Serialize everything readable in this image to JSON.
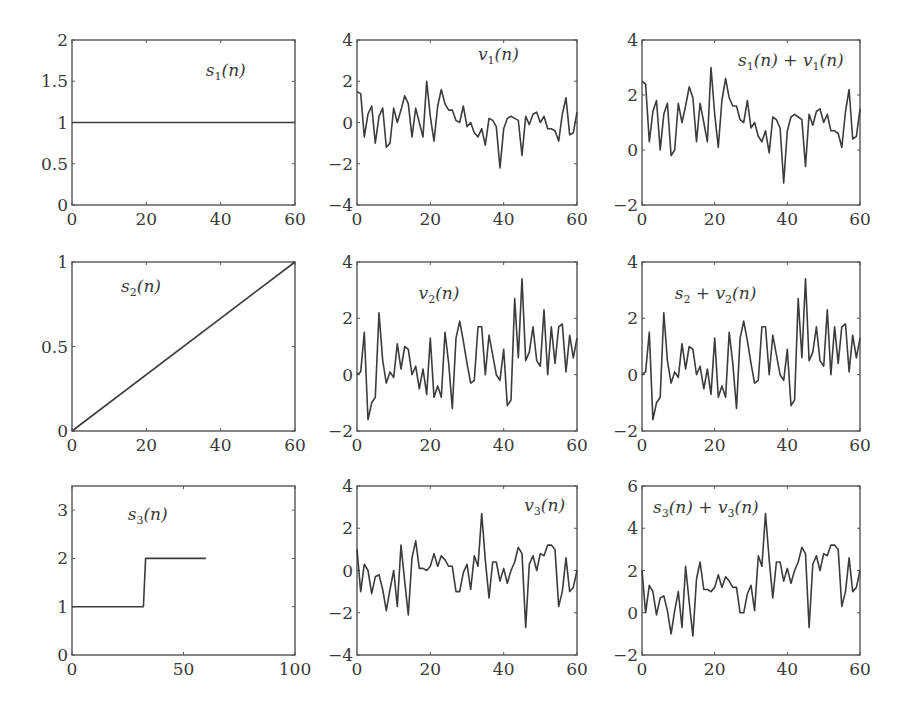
{
  "figure": {
    "layout": "3x3 grid of subplots",
    "line_color": "#3c3c3c",
    "axis_color": "#555555"
  },
  "chart_data": [
    {
      "id": "s1",
      "type": "line",
      "row": 0,
      "col": 0,
      "title": "s1(n)",
      "label_main": "s",
      "label_sub": "1",
      "label_tail": "(n)",
      "label_pos": [
        0.6,
        0.78
      ],
      "box": [
        72,
        40,
        295,
        205
      ],
      "xlim": [
        0,
        60
      ],
      "ylim": [
        0,
        2
      ],
      "xticks": [
        0,
        20,
        40,
        60
      ],
      "yticks": [
        0,
        0.5,
        1,
        1.5,
        2
      ],
      "ytick_labels": [
        "0",
        "0.5",
        "1",
        "1.5",
        "2"
      ],
      "x": [
        0,
        60
      ],
      "y": [
        1,
        1
      ]
    },
    {
      "id": "v1",
      "type": "line",
      "row": 0,
      "col": 1,
      "title": "v1(n)",
      "label_main": "v",
      "label_sub": "1",
      "label_tail": "(n)",
      "label_pos": [
        0.55,
        0.88
      ],
      "box": [
        357,
        40,
        577,
        205
      ],
      "xlim": [
        0,
        60
      ],
      "ylim": [
        -4,
        4
      ],
      "xticks": [
        0,
        20,
        40,
        60
      ],
      "yticks": [
        -4,
        -2,
        0,
        2,
        4
      ],
      "ytick_labels": [
        "−4",
        "−2",
        "0",
        "2",
        "4"
      ],
      "y": [
        1.5,
        1.4,
        -0.7,
        0.4,
        0.8,
        -1.0,
        0.3,
        0.7,
        -1.2,
        -1.0,
        0.7,
        0.0,
        0.6,
        1.3,
        0.9,
        -0.7,
        0.7,
        0.0,
        -0.7,
        2.0,
        0.3,
        -0.9,
        0.8,
        1.6,
        0.9,
        0.6,
        0.6,
        0.1,
        0.0,
        0.8,
        -0.2,
        0.0,
        -0.5,
        -0.7,
        -0.3,
        -1.1,
        0.2,
        0.1,
        -0.2,
        -2.2,
        -0.3,
        0.2,
        0.3,
        0.2,
        0.1,
        -1.6,
        0.3,
        -0.1,
        0.4,
        0.5,
        0.0,
        0.3,
        -0.3,
        -0.3,
        -0.4,
        -0.9,
        0.4,
        1.2,
        -0.6,
        -0.5,
        0.5
      ]
    },
    {
      "id": "s1v1",
      "type": "line",
      "row": 0,
      "col": 2,
      "title": "s1(n) + v1(n)",
      "label_main": "s",
      "label_sub": "1",
      "label_tail": "(n) + v",
      "label_sub2": "1",
      "label_tail2": "(n)",
      "label_pos": [
        0.44,
        0.84
      ],
      "box": [
        642,
        40,
        860,
        205
      ],
      "xlim": [
        0,
        60
      ],
      "ylim": [
        -2,
        4
      ],
      "xticks": [
        0,
        20,
        40,
        60
      ],
      "yticks": [
        -2,
        0,
        2,
        4
      ],
      "ytick_labels": [
        "−2",
        "0",
        "2",
        "4"
      ],
      "y": [
        2.5,
        2.4,
        0.3,
        1.4,
        1.8,
        0.0,
        1.3,
        1.7,
        -0.2,
        0.0,
        1.7,
        1.0,
        1.6,
        2.3,
        1.9,
        0.3,
        1.7,
        1.0,
        0.3,
        3.0,
        1.3,
        0.1,
        1.8,
        2.6,
        1.9,
        1.6,
        1.6,
        1.1,
        1.0,
        1.8,
        0.8,
        1.0,
        0.5,
        0.3,
        0.7,
        -0.1,
        1.2,
        1.1,
        0.8,
        -1.2,
        0.7,
        1.2,
        1.3,
        1.2,
        1.1,
        -0.6,
        1.3,
        0.9,
        1.4,
        1.5,
        1.0,
        1.3,
        0.7,
        0.7,
        0.6,
        0.1,
        1.4,
        2.2,
        0.4,
        0.5,
        1.5
      ]
    },
    {
      "id": "s2",
      "type": "line",
      "row": 1,
      "col": 0,
      "title": "s2(n)",
      "label_main": "s",
      "label_sub": "2",
      "label_tail": "(n)",
      "label_pos": [
        0.22,
        0.82
      ],
      "box": [
        72,
        262,
        295,
        431
      ],
      "xlim": [
        0,
        60
      ],
      "ylim": [
        0,
        1
      ],
      "xticks": [
        0,
        20,
        40,
        60
      ],
      "yticks": [
        0,
        0.5,
        1
      ],
      "ytick_labels": [
        "0",
        "0.5",
        "1"
      ],
      "x": [
        0,
        60
      ],
      "y": [
        0,
        1
      ]
    },
    {
      "id": "v2",
      "type": "line",
      "row": 1,
      "col": 1,
      "title": "v2(n)",
      "label_main": "v",
      "label_sub": "2",
      "label_tail": "(n)",
      "label_pos": [
        0.28,
        0.78
      ],
      "box": [
        357,
        262,
        577,
        431
      ],
      "xlim": [
        0,
        60
      ],
      "ylim": [
        -2,
        4
      ],
      "xticks": [
        0,
        20,
        40,
        60
      ],
      "yticks": [
        -2,
        0,
        2,
        4
      ],
      "ytick_labels": [
        "−2",
        "0",
        "2",
        "4"
      ],
      "y": [
        0.0,
        0.1,
        1.5,
        -1.6,
        -1.0,
        -0.8,
        2.2,
        0.5,
        -0.3,
        0.1,
        -0.1,
        1.1,
        0.2,
        1.0,
        0.9,
        0.0,
        0.3,
        -0.5,
        0.2,
        -0.7,
        1.3,
        -0.8,
        -0.4,
        -0.8,
        1.5,
        0.4,
        -1.2,
        1.3,
        1.9,
        1.2,
        0.4,
        -0.3,
        -0.2,
        1.7,
        1.7,
        0.0,
        1.4,
        0.7,
        0.0,
        -0.2,
        0.9,
        -1.1,
        -0.9,
        2.7,
        0.6,
        3.4,
        0.5,
        0.8,
        1.7,
        0.5,
        0.3,
        2.3,
        0.0,
        1.7,
        0.4,
        1.7,
        1.8,
        0.1,
        1.4,
        0.6,
        1.3
      ]
    },
    {
      "id": "s2v2",
      "type": "line",
      "row": 1,
      "col": 2,
      "title": "s2 + v2(n)",
      "label_main": "s",
      "label_sub": "2",
      "label_tail": " + v",
      "label_sub2": "2",
      "label_tail2": "(n)",
      "label_pos": [
        0.15,
        0.78
      ],
      "box": [
        642,
        262,
        860,
        431
      ],
      "xlim": [
        0,
        60
      ],
      "ylim": [
        -2,
        4
      ],
      "xticks": [
        0,
        20,
        40,
        60
      ],
      "yticks": [
        -2,
        0,
        2,
        4
      ],
      "ytick_labels": [
        "−2",
        "0",
        "2",
        "4"
      ],
      "y": [
        0.0,
        0.1,
        1.5,
        -1.6,
        -1.0,
        -0.8,
        2.2,
        0.5,
        -0.3,
        0.1,
        -0.1,
        1.1,
        0.2,
        1.0,
        0.9,
        0.0,
        0.3,
        -0.5,
        0.2,
        -0.7,
        1.3,
        -0.8,
        -0.4,
        -0.8,
        1.5,
        0.4,
        -1.2,
        1.3,
        1.9,
        1.2,
        0.4,
        -0.3,
        -0.2,
        1.7,
        1.7,
        0.0,
        1.4,
        0.7,
        0.0,
        -0.2,
        0.9,
        -1.1,
        -0.9,
        2.7,
        0.6,
        3.4,
        0.5,
        0.8,
        1.7,
        0.5,
        0.3,
        2.3,
        0.0,
        1.7,
        0.4,
        1.7,
        1.8,
        0.1,
        1.4,
        0.6,
        1.3
      ]
    },
    {
      "id": "s3",
      "type": "line",
      "row": 2,
      "col": 0,
      "title": "s3(n)",
      "label_main": "s",
      "label_sub": "3",
      "label_tail": "(n)",
      "label_pos": [
        0.25,
        0.8
      ],
      "box": [
        72,
        486,
        295,
        655
      ],
      "xlim": [
        0,
        100
      ],
      "ylim": [
        0,
        3.5
      ],
      "xticks": [
        0,
        50,
        100
      ],
      "yticks": [
        0,
        1,
        2,
        3
      ],
      "ytick_labels": [
        "0",
        "1",
        "2",
        "3"
      ],
      "x": [
        0,
        32,
        33,
        60
      ],
      "y": [
        1,
        1,
        2,
        2
      ]
    },
    {
      "id": "v3",
      "type": "line",
      "row": 2,
      "col": 1,
      "title": "v3(n)",
      "label_main": "v",
      "label_sub": "3",
      "label_tail": "(n)",
      "label_pos": [
        0.76,
        0.85
      ],
      "box": [
        357,
        486,
        577,
        655
      ],
      "xlim": [
        0,
        60
      ],
      "ylim": [
        -4,
        4
      ],
      "xticks": [
        0,
        20,
        40,
        60
      ],
      "yticks": [
        -4,
        -2,
        0,
        2,
        4
      ],
      "ytick_labels": [
        "−4",
        "−2",
        "0",
        "2",
        "4"
      ],
      "y": [
        1.0,
        -1.0,
        0.3,
        0.0,
        -1.1,
        -0.3,
        -0.2,
        -0.9,
        -1.9,
        -0.9,
        0.0,
        -1.7,
        1.2,
        -0.5,
        -2.1,
        0.6,
        1.4,
        0.1,
        0.1,
        0.0,
        0.2,
        0.8,
        0.2,
        0.7,
        0.5,
        0.2,
        0.2,
        -1.0,
        -1.0,
        -0.1,
        0.3,
        -0.9,
        0.7,
        0.2,
        2.7,
        0.5,
        -1.3,
        0.4,
        0.4,
        -0.5,
        0.1,
        -0.6,
        0.0,
        0.4,
        1.1,
        0.8,
        -2.7,
        0.3,
        0.7,
        0.0,
        0.8,
        0.7,
        1.2,
        1.2,
        1.0,
        -1.7,
        -1.0,
        0.6,
        -1.0,
        -0.8,
        0.0
      ]
    },
    {
      "id": "s3v3",
      "type": "line",
      "row": 2,
      "col": 2,
      "title": "s3(n) + v3(n)",
      "label_main": "s",
      "label_sub": "3",
      "label_tail": "(n) + v",
      "label_sub2": "3",
      "label_tail2": "(n)",
      "label_pos": [
        0.05,
        0.84
      ],
      "box": [
        642,
        486,
        860,
        655
      ],
      "xlim": [
        0,
        60
      ],
      "ylim": [
        -2,
        6
      ],
      "xticks": [
        0,
        20,
        40,
        60
      ],
      "yticks": [
        -2,
        0,
        2,
        4,
        6
      ],
      "ytick_labels": [
        "−2",
        "0",
        "2",
        "4",
        "6"
      ],
      "y": [
        2.0,
        0.0,
        1.3,
        1.0,
        -0.1,
        0.7,
        0.8,
        0.1,
        -1.0,
        0.1,
        1.0,
        -0.7,
        2.2,
        0.5,
        -1.1,
        1.6,
        2.4,
        1.1,
        1.1,
        1.0,
        1.2,
        1.8,
        1.2,
        1.7,
        1.5,
        1.2,
        1.2,
        0.0,
        0.0,
        0.9,
        1.3,
        0.1,
        2.7,
        2.2,
        4.7,
        2.5,
        0.7,
        2.4,
        2.4,
        1.5,
        2.1,
        1.4,
        2.0,
        2.4,
        3.1,
        2.8,
        -0.7,
        2.3,
        2.7,
        2.0,
        2.8,
        2.7,
        3.2,
        3.2,
        3.0,
        0.3,
        1.0,
        2.6,
        1.0,
        1.2,
        2.0
      ]
    }
  ]
}
